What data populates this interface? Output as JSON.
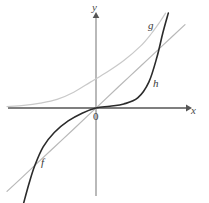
{
  "figure": {
    "title": "",
    "background_color": "#ffffff"
  },
  "axes": {
    "x_label": "x",
    "y_label": "y",
    "origin_label": "0",
    "axis_color": "#555555",
    "x_axis_y_px": 108,
    "y_axis_x_px": 96
  },
  "labels": {
    "f": "f",
    "g": "g",
    "h": "h"
  },
  "chart_data": {
    "type": "line",
    "title": "",
    "xlabel": "x",
    "ylabel": "y",
    "grid": false,
    "legend": "inline-curve-labels",
    "xlim": [
      -3.2,
      3.2
    ],
    "ylim": [
      -3.2,
      3.2
    ],
    "series": [
      {
        "name": "f",
        "label": "f",
        "description": "straight line through the origin with positive slope",
        "color": "#b8b8b8",
        "style": "solid",
        "width": 1.2,
        "x": [
          -3.2,
          -2.4,
          -1.6,
          -0.8,
          0,
          0.8,
          1.6,
          2.4,
          3.2
        ],
        "y": [
          -2.9,
          -2.18,
          -1.45,
          -0.73,
          0,
          0.73,
          1.45,
          2.18,
          2.9
        ]
      },
      {
        "name": "g",
        "label": "g",
        "description": "increasing exponential-type curve, asymptotic to the x-axis on the left, rising steeply on the right",
        "color": "#c9c9c9",
        "style": "solid",
        "width": 1.2,
        "x": [
          -3.2,
          -2.6,
          -2.0,
          -1.4,
          -0.8,
          -0.2,
          0.4,
          1.0,
          1.6,
          2.0,
          2.3,
          2.5
        ],
        "y": [
          0.05,
          0.09,
          0.17,
          0.3,
          0.55,
          0.9,
          1.25,
          1.65,
          2.15,
          2.6,
          3.0,
          3.3
        ]
      },
      {
        "name": "h",
        "label": "h",
        "description": "dark curve nearly flat along the x-axis for positive x then rising very steeply; left branch drops steeply below the axis",
        "color": "#2b2b2b",
        "style": "solid",
        "width": 1.6,
        "x": [
          -2.6,
          -2.4,
          -2.2,
          -1.9,
          -1.5,
          -1.0,
          -0.5,
          0,
          0.5,
          1.0,
          1.5,
          1.9,
          2.2,
          2.4,
          2.6
        ],
        "y": [
          -3.3,
          -2.6,
          -2.0,
          -1.35,
          -0.85,
          -0.45,
          -0.18,
          0,
          0.06,
          0.14,
          0.35,
          0.9,
          1.8,
          2.6,
          3.3
        ]
      }
    ]
  }
}
